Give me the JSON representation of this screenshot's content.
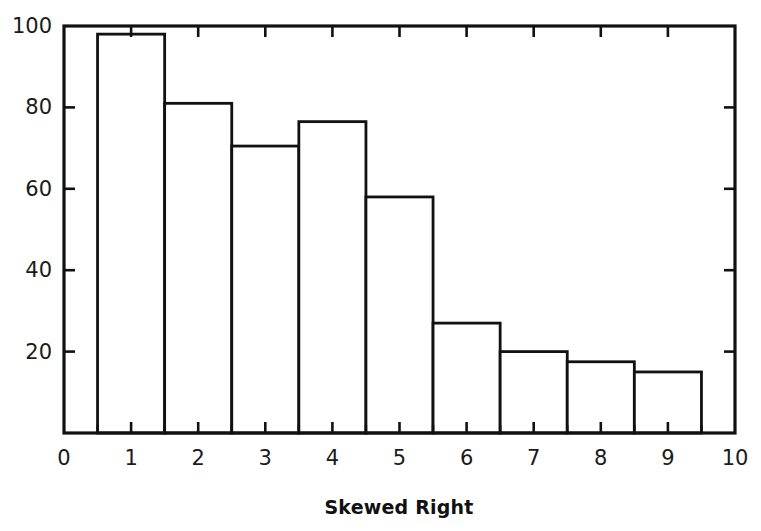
{
  "chart_data": {
    "type": "bar",
    "title": "Skewed Right",
    "subtitle": "",
    "xlabel": "",
    "ylabel": "",
    "categories": [
      "1",
      "2",
      "3",
      "4",
      "5",
      "6",
      "7",
      "8",
      "9"
    ],
    "bin_centers": [
      1,
      2,
      3,
      4,
      5,
      6,
      7,
      8,
      9
    ],
    "bin_edges": [
      0.5,
      1.5,
      2.5,
      3.5,
      4.5,
      5.5,
      6.5,
      7.5,
      8.5,
      9.5
    ],
    "values": [
      98,
      81,
      70.5,
      76.5,
      58,
      27,
      20,
      17.5,
      15
    ],
    "xlim": [
      0,
      10
    ],
    "ylim": [
      0,
      100
    ],
    "x_tick_labels": [
      "0",
      "1",
      "2",
      "3",
      "4",
      "5",
      "6",
      "7",
      "8",
      "9",
      "10"
    ],
    "x_tick_values": [
      0,
      1,
      2,
      3,
      4,
      5,
      6,
      7,
      8,
      9,
      10
    ],
    "x_minor_tick_values": [
      0.5,
      1.5,
      2.5,
      3.5,
      4.5,
      5.5,
      6.5,
      7.5,
      8.5,
      9.5
    ],
    "y_tick_labels": [
      "20",
      "40",
      "60",
      "80",
      "100"
    ],
    "y_tick_values": [
      20,
      40,
      60,
      80,
      100
    ],
    "grid": false,
    "legend": false,
    "frame": "full-box",
    "tick_direction": "in",
    "bar_fill": "#ffffff",
    "bar_edge_color": "#111111",
    "axis_color": "#111111",
    "background": "#ffffff"
  }
}
